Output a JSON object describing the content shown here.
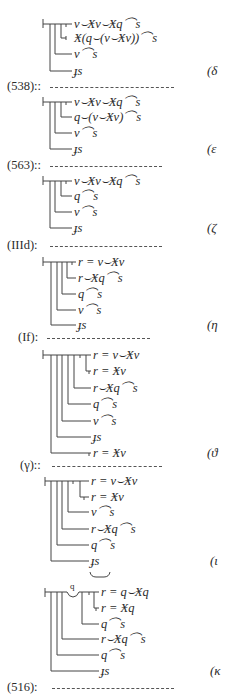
{
  "blocks": [
    {
      "tag": "(δ",
      "rows": [
        "v⌣Ӿv⌣Ӿq⌒s",
        "Ӿ(q⌣(v⌣Ӿv))⌒s",
        "v⌒s",
        "ɟs"
      ]
    },
    {
      "separator_label": "(538)::",
      "tag": "(ε",
      "rows": [
        "v⌣Ӿv⌣Ӿq⌒s",
        "q⌣(v⌣Ӿv)⌒s",
        "v⌒s",
        "ɟs"
      ]
    },
    {
      "separator_label": "(563)::",
      "tag": "(ζ",
      "rows": [
        "v⌣Ӿv⌣Ӿq⌒s",
        "q⌒s",
        "v⌒s",
        "ɟs"
      ]
    },
    {
      "separator_label": "(IIId):",
      "tag": "(η",
      "rows": [
        "r = v⌣Ӿv",
        "r⌣Ӿq⌒s",
        "q⌒s",
        "v⌒s",
        "ɟs"
      ]
    },
    {
      "separator_label": "(If):",
      "tag": "(ϑ",
      "rows": [
        "r = v⌣Ӿv",
        "r = Ӿv",
        "r⌣Ӿq⌒s",
        "q⌒s",
        "v⌒s",
        "ɟs",
        "r = Ӿv"
      ]
    },
    {
      "separator_label": "(γ)::",
      "tag": "(ι",
      "rows": [
        "r = v⌣Ӿv",
        "r = Ӿv",
        "v⌒s",
        "r⌣Ӿq⌒s",
        "q⌒s",
        "ɟs"
      ]
    },
    {
      "concavity_letter": "q",
      "tag": "(κ",
      "rows": [
        "r = q⌣Ӿq",
        "r = Ӿq",
        "q⌒s",
        "r⌣Ӿq⌒s",
        "q⌒s",
        "ɟs"
      ]
    }
  ],
  "final_separator_label": "(516):"
}
